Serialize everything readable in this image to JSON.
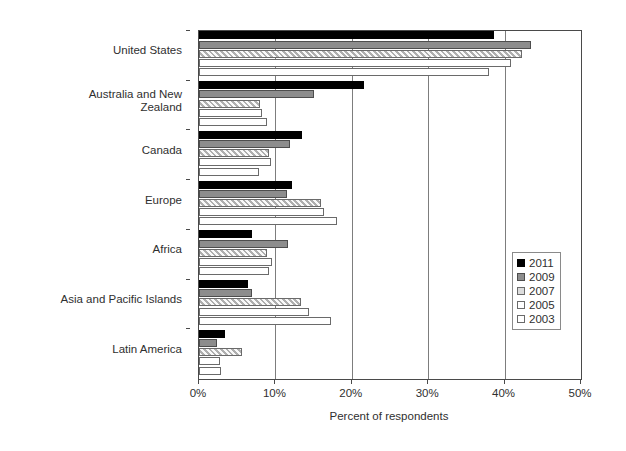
{
  "chart_data": {
    "type": "bar",
    "orientation": "horizontal",
    "title": "",
    "xlabel": "Percent of respondents",
    "ylabel": "",
    "xlim": [
      0,
      50
    ],
    "xticks": [
      "0%",
      "10%",
      "20%",
      "30%",
      "40%",
      "50%"
    ],
    "xtick_values": [
      0,
      10,
      20,
      30,
      40,
      50
    ],
    "grid": "vertical",
    "legend_position": "right-lower",
    "categories": [
      "United States",
      "Australia and New\nZealand",
      "Canada",
      "Europe",
      "Africa",
      "Asia and Pacific Islands",
      "Latin America"
    ],
    "series": [
      {
        "name": "2011",
        "color": "#000000",
        "values": [
          38.6,
          21.6,
          13.5,
          12.2,
          6.9,
          6.4,
          3.4
        ]
      },
      {
        "name": "2009",
        "color": "#8d8d8d",
        "values": [
          43.4,
          15.0,
          11.9,
          11.5,
          11.6,
          7.0,
          2.3
        ]
      },
      {
        "name": "2007",
        "color": "#d8d8d8",
        "values": [
          42.3,
          8.0,
          9.1,
          16.0,
          8.9,
          13.3,
          5.6
        ]
      },
      {
        "name": "2005",
        "color": "#ffffff",
        "values": [
          40.9,
          8.3,
          9.4,
          16.4,
          9.5,
          14.4,
          2.8
        ]
      },
      {
        "name": "2003",
        "color": "#ffffff",
        "values": [
          38.0,
          8.9,
          7.9,
          18.0,
          9.2,
          17.3,
          2.9
        ]
      }
    ]
  },
  "legend": {
    "items": [
      {
        "label": "2011"
      },
      {
        "label": "2009"
      },
      {
        "label": "2007"
      },
      {
        "label": "2005"
      },
      {
        "label": "2003"
      }
    ]
  },
  "axis": {
    "x_title": "Percent of respondents"
  }
}
